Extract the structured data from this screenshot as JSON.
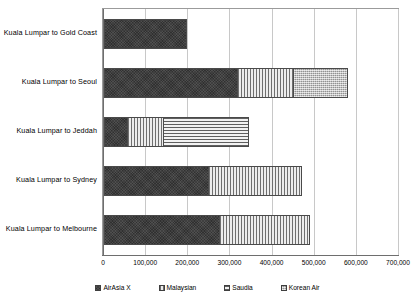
{
  "chart_data": {
    "type": "bar",
    "orientation": "horizontal",
    "stacked": true,
    "title": "",
    "xlabel": "",
    "ylabel": "",
    "xlim": [
      0,
      700000
    ],
    "xticks": [
      "0",
      "100,000",
      "200,000",
      "300,000",
      "400,000",
      "500,000",
      "600,000",
      "700,000"
    ],
    "xtick_values": [
      0,
      100000,
      200000,
      300000,
      400000,
      500000,
      600000,
      700000
    ],
    "grid": true,
    "legend_position": "bottom",
    "categories": [
      "Kuala Lumpar to Gold Coast",
      "Kuala Lumpar to Seoul",
      "Kuala Lumpar to Jeddah",
      "Kuala Lumpar to Sydney",
      "Kuala Lumpar to Melbourne"
    ],
    "series": [
      {
        "name": "AirAsia X",
        "pattern": "airasia",
        "color": "#3a3a3a",
        "values": [
          197000,
          317000,
          57000,
          248000,
          276000
        ]
      },
      {
        "name": "Malaysian",
        "pattern": "malaysian",
        "color": "#e8e8e8",
        "values": [
          0,
          135000,
          86000,
          221000,
          212000
        ]
      },
      {
        "name": "Saudia",
        "pattern": "saudia",
        "color": "#ededed",
        "values": [
          0,
          0,
          200000,
          0,
          0
        ]
      },
      {
        "name": "Korean Air",
        "pattern": "korean",
        "color": "#b9b9b9",
        "values": [
          0,
          126000,
          0,
          0,
          0
        ]
      }
    ],
    "totals": [
      197000,
      578000,
      343000,
      469000,
      488000
    ]
  }
}
